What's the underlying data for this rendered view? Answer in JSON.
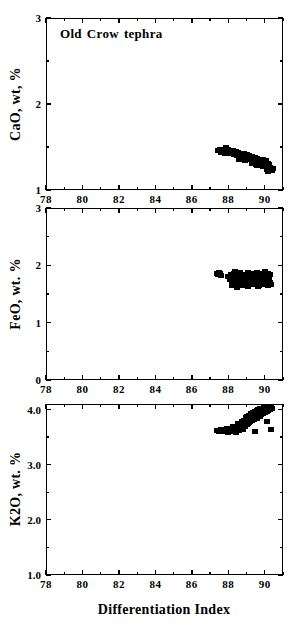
{
  "figure": {
    "xtitle": "Differentiation  Index",
    "annotation": {
      "word1": "Old",
      "word2": "Crow",
      "word3": "tephra"
    },
    "marker_color": "#000000",
    "axis_color": "#000000"
  },
  "chart_data": [
    {
      "type": "scatter",
      "title": "Old Crow tephra",
      "panel": "CaO",
      "ylabel": "CaO, wt, %",
      "xlabel": "Differentiation  Index",
      "xlim": [
        78,
        91
      ],
      "ylim": [
        1,
        3
      ],
      "xticks": [
        78,
        80,
        82,
        84,
        86,
        88,
        90
      ],
      "xticklabels": [
        "78",
        "80",
        "82",
        "84",
        "86",
        "88",
        "90"
      ],
      "xminorticks": [
        79,
        81,
        83,
        85,
        87,
        89,
        91
      ],
      "yticks": [
        1,
        2,
        3
      ],
      "yticklabels": [
        "1",
        "2",
        "3"
      ],
      "yminorticks": [
        1.5,
        2.5
      ],
      "grid": false,
      "legend": false,
      "x": [
        87.45,
        87.55,
        87.6,
        87.7,
        87.75,
        87.8,
        87.85,
        87.9,
        87.95,
        88.0,
        88.05,
        88.1,
        88.15,
        88.2,
        88.25,
        88.3,
        88.35,
        88.4,
        88.45,
        88.5,
        88.55,
        88.6,
        88.65,
        88.7,
        88.75,
        88.8,
        88.85,
        88.9,
        88.95,
        89.0,
        89.05,
        89.1,
        89.15,
        89.2,
        89.25,
        89.3,
        89.35,
        89.4,
        89.45,
        89.5,
        89.55,
        89.6,
        89.65,
        89.7,
        89.75,
        89.8,
        89.85,
        89.9,
        89.95,
        90.0,
        90.05,
        90.1,
        90.15,
        90.2,
        90.25,
        90.3,
        90.35,
        90.4,
        90.45,
        88.6,
        88.9,
        89.3,
        89.6,
        89.9,
        90.1,
        88.4,
        89.0,
        89.5,
        90.2,
        87.9
      ],
      "y": [
        1.46,
        1.47,
        1.44,
        1.45,
        1.47,
        1.43,
        1.46,
        1.44,
        1.45,
        1.47,
        1.43,
        1.45,
        1.42,
        1.44,
        1.46,
        1.41,
        1.43,
        1.45,
        1.4,
        1.42,
        1.44,
        1.39,
        1.41,
        1.43,
        1.38,
        1.4,
        1.42,
        1.37,
        1.39,
        1.41,
        1.36,
        1.38,
        1.4,
        1.35,
        1.37,
        1.39,
        1.34,
        1.36,
        1.38,
        1.33,
        1.35,
        1.37,
        1.32,
        1.34,
        1.36,
        1.31,
        1.33,
        1.35,
        1.3,
        1.32,
        1.34,
        1.29,
        1.31,
        1.28,
        1.3,
        1.26,
        1.24,
        1.23,
        1.25,
        1.36,
        1.34,
        1.31,
        1.29,
        1.27,
        1.24,
        1.41,
        1.35,
        1.3,
        1.22,
        1.49
      ]
    },
    {
      "type": "scatter",
      "panel": "FeO",
      "ylabel": "FeO, wt. %",
      "xlabel": "Differentiation  Index",
      "xlim": [
        78,
        91
      ],
      "ylim": [
        0,
        3
      ],
      "xticks": [
        78,
        80,
        82,
        84,
        86,
        88,
        90
      ],
      "xticklabels": [
        "78",
        "80",
        "82",
        "84",
        "86",
        "88",
        "90"
      ],
      "xminorticks": [
        79,
        81,
        83,
        85,
        87,
        89,
        91
      ],
      "yticks": [
        0,
        1,
        2,
        3
      ],
      "yticklabels": [
        "0",
        "1",
        "2",
        "3"
      ],
      "yminorticks": [
        0.5,
        1.5,
        2.5
      ],
      "grid": false,
      "legend": false,
      "x": [
        87.4,
        87.45,
        87.5,
        87.55,
        87.6,
        88.0,
        88.1,
        88.15,
        88.2,
        88.25,
        88.3,
        88.35,
        88.4,
        88.45,
        88.5,
        88.55,
        88.6,
        88.65,
        88.7,
        88.75,
        88.8,
        88.85,
        88.9,
        88.95,
        89.0,
        89.05,
        89.1,
        89.15,
        89.2,
        89.25,
        89.3,
        89.35,
        89.4,
        89.45,
        89.5,
        89.55,
        89.6,
        89.65,
        89.7,
        89.75,
        89.8,
        89.85,
        89.9,
        89.95,
        90.0,
        90.05,
        90.1,
        90.15,
        90.2,
        90.25,
        90.3,
        90.35,
        88.2,
        88.5,
        88.8,
        89.1,
        89.4,
        89.7,
        90.0,
        90.2,
        88.35,
        88.65,
        89.25,
        89.55,
        89.85,
        90.15,
        88.45,
        89.05,
        89.65,
        90.3
      ],
      "y": [
        1.86,
        1.84,
        1.87,
        1.85,
        1.83,
        1.8,
        1.76,
        1.84,
        1.72,
        1.79,
        1.86,
        1.7,
        1.77,
        1.83,
        1.68,
        1.75,
        1.81,
        1.88,
        1.71,
        1.78,
        1.84,
        1.69,
        1.76,
        1.82,
        1.74,
        1.8,
        1.87,
        1.72,
        1.78,
        1.85,
        1.7,
        1.77,
        1.83,
        1.75,
        1.81,
        1.88,
        1.73,
        1.79,
        1.86,
        1.71,
        1.78,
        1.84,
        1.76,
        1.82,
        1.89,
        1.74,
        1.8,
        1.86,
        1.72,
        1.78,
        1.84,
        1.66,
        1.64,
        1.67,
        1.65,
        1.63,
        1.66,
        1.64,
        1.67,
        1.65,
        1.9,
        1.74,
        1.68,
        1.73,
        1.69,
        1.71,
        1.62,
        1.67,
        1.63,
        1.7
      ]
    },
    {
      "type": "scatter",
      "panel": "K2O",
      "ylabel": "K2O, wt. %",
      "xlabel": "Differentiation  Index",
      "xlim": [
        78,
        91
      ],
      "ylim": [
        1.0,
        4.1
      ],
      "xticks": [
        78,
        80,
        82,
        84,
        86,
        88,
        90
      ],
      "xticklabels": [
        "78",
        "80",
        "82",
        "84",
        "86",
        "88",
        "90"
      ],
      "xminorticks": [
        79,
        81,
        83,
        85,
        87,
        89,
        91
      ],
      "yticks": [
        1.0,
        2.0,
        3.0,
        4.0
      ],
      "yticklabels": [
        "1.0",
        "2.0",
        "3.0",
        "4.0"
      ],
      "yminorticks": [
        1.5,
        2.5,
        3.5
      ],
      "grid": false,
      "legend": false,
      "x": [
        87.4,
        87.5,
        87.6,
        87.7,
        87.8,
        87.9,
        88.0,
        88.1,
        88.2,
        88.3,
        88.4,
        88.5,
        88.6,
        88.7,
        88.8,
        88.85,
        88.9,
        88.95,
        89.0,
        89.05,
        89.1,
        89.15,
        89.2,
        89.25,
        89.3,
        89.35,
        89.4,
        89.45,
        89.5,
        89.55,
        89.6,
        89.65,
        89.7,
        89.75,
        89.8,
        89.85,
        89.9,
        89.95,
        90.0,
        90.05,
        90.1,
        90.15,
        90.2,
        90.25,
        90.3,
        90.35,
        90.4,
        88.25,
        88.55,
        88.75,
        89.05,
        89.35,
        89.65,
        89.95,
        90.15,
        88.45,
        89.15,
        89.55,
        89.85,
        90.25,
        88.65,
        89.25,
        89.75,
        90.05,
        90.3,
        88.15,
        89.45,
        90.1,
        90.35,
        87.95
      ],
      "y": [
        3.62,
        3.6,
        3.63,
        3.61,
        3.64,
        3.62,
        3.58,
        3.65,
        3.6,
        3.63,
        3.59,
        3.66,
        3.62,
        3.68,
        3.64,
        3.8,
        3.7,
        3.85,
        3.72,
        3.88,
        3.75,
        3.9,
        3.78,
        3.92,
        3.8,
        3.95,
        3.82,
        3.97,
        3.85,
        3.98,
        3.87,
        4.0,
        3.89,
        4.01,
        3.91,
        4.02,
        3.93,
        4.03,
        3.95,
        4.04,
        3.97,
        4.05,
        3.99,
        4.06,
        4.0,
        4.07,
        4.02,
        3.7,
        3.74,
        3.78,
        3.82,
        3.86,
        3.9,
        3.94,
        3.98,
        3.66,
        3.76,
        3.84,
        3.92,
        4.0,
        3.72,
        3.8,
        3.88,
        3.96,
        4.04,
        3.61,
        3.6,
        3.78,
        3.63,
        3.65
      ]
    }
  ]
}
